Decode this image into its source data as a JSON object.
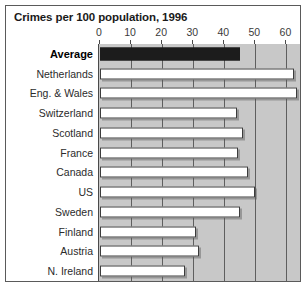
{
  "chart_data": {
    "type": "bar",
    "orientation": "horizontal",
    "title": "Crimes per 100 population, 1996",
    "xlabel": "",
    "ylabel": "",
    "xlim": [
      0,
      65
    ],
    "xticks": [
      0,
      10,
      20,
      30,
      40,
      50,
      60
    ],
    "xtick_labels": [
      "0",
      "10",
      "20",
      "30",
      "40",
      "50",
      "60"
    ],
    "grid": true,
    "legend": null,
    "categories": [
      "Average",
      "Netherlands",
      "Eng. & Wales",
      "Switzerland",
      "Scotland",
      "France",
      "Canada",
      "US",
      "Sweden",
      "Finland",
      "Austria",
      "N. Ireland"
    ],
    "values": [
      45,
      62.5,
      63.5,
      44,
      46,
      44.5,
      47.5,
      50,
      45,
      31,
      32,
      27.5
    ],
    "highlight_category": "Average",
    "colors": {
      "highlight_bar": "#1c1c1c",
      "bar_fill": "#ffffff",
      "bar_edge": "#3c3c3c",
      "plot_background": "#c8c8c8",
      "gridline": "#5f5f5f",
      "frame": "#5a5a5a",
      "text": "#2b2b2b"
    }
  }
}
